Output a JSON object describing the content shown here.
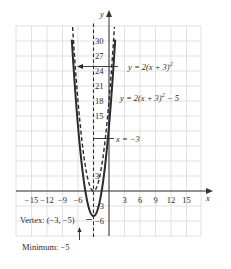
{
  "chart_data": {
    "type": "line",
    "title": "",
    "xlabel": "x",
    "ylabel": "y",
    "xlim": [
      -18,
      18
    ],
    "ylim": [
      -9,
      33
    ],
    "grid": true,
    "x_ticks": [
      -15,
      -12,
      -9,
      -6,
      3,
      6,
      9,
      12,
      15
    ],
    "x_tick_labels": [
      "−15",
      "−12",
      "−9",
      "−6",
      "3",
      "6",
      "9",
      "12",
      "15"
    ],
    "y_ticks": [
      30,
      27,
      24,
      21,
      18,
      15,
      3,
      -3,
      -6
    ],
    "y_tick_labels": [
      "30",
      "27",
      "24",
      "21",
      "18",
      "15",
      "3",
      "−3",
      "−6"
    ],
    "series": [
      {
        "name": "y = 2(x + 3)^2",
        "style": "dashed",
        "equation": "y = 2(x+3)^2",
        "vertex": [
          -3,
          0
        ],
        "x": [
          -7,
          -6,
          -5,
          -4,
          -3,
          -2,
          -1,
          0,
          1
        ],
        "values": [
          32,
          18,
          8,
          2,
          0,
          2,
          8,
          18,
          32
        ]
      },
      {
        "name": "y = 2(x + 3)^2 − 5",
        "style": "solid",
        "equation": "y = 2(x+3)^2 - 5",
        "vertex": [
          -3,
          -5
        ],
        "x": [
          -7,
          -6,
          -5,
          -4,
          -3,
          -2,
          -1,
          0,
          1
        ],
        "values": [
          27,
          13,
          3,
          -3,
          -5,
          -3,
          3,
          13,
          27
        ]
      },
      {
        "name": "x = −3",
        "style": "dashed",
        "equation": "x = -3",
        "type": "axis_of_symmetry"
      }
    ],
    "annotations": [
      {
        "text": "y = 2(x + 3)^2",
        "points_to": "dashed parabola"
      },
      {
        "text": "y = 2(x + 3)^2 − 5",
        "points_to": "solid parabola"
      },
      {
        "text": "x = −3",
        "points_to": "axis of symmetry"
      },
      {
        "text": "Vertex: (−3, −5)",
        "points_to": "vertex of solid parabola"
      },
      {
        "text": "Minimum: −5",
        "points_to": "minimum value"
      }
    ]
  },
  "labels": {
    "axis_x": "x",
    "axis_y": "y",
    "eq1_main": "y = 2(x + 3)",
    "eq1_exp": "2",
    "eq2_main": "y = 2(x + 3)",
    "eq2_exp": "2",
    "eq2_tail": " − 5",
    "axis_sym": "x = −3",
    "vertex": "Vertex: (−3, −5)",
    "minimum": "Minimum: −5"
  },
  "colors": {
    "grid": "#d9d9d9",
    "axis": "#333333",
    "curve": "#2b2b2b",
    "text": "#2a2a2a"
  }
}
